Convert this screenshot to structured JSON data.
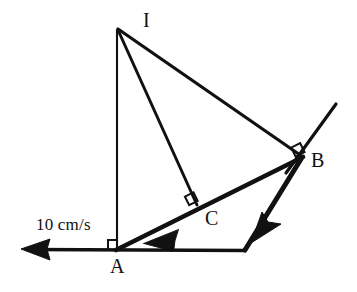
{
  "diagram": {
    "type": "geometry-kinematics-diagram",
    "title": "",
    "stroke_color": "#111111",
    "background_color": "#ffffff",
    "points": [
      {
        "id": "I",
        "label": "I",
        "x": 117,
        "y": 28,
        "label_x": 143,
        "label_y": 12
      },
      {
        "id": "A",
        "label": "A",
        "x": 117,
        "y": 249,
        "label_x": 111,
        "label_y": 258
      },
      {
        "id": "B",
        "label": "B",
        "x": 302,
        "y": 157,
        "label_x": 311,
        "label_y": 152
      },
      {
        "id": "C",
        "label": "C",
        "x": 197,
        "y": 204,
        "label_x": 205,
        "label_y": 209
      }
    ],
    "segments": [
      {
        "name": "segment-I-A",
        "from": "I",
        "to": "A",
        "width": 2.0
      },
      {
        "name": "segment-I-B",
        "from": "I",
        "to": "B",
        "width": 3.0
      },
      {
        "name": "segment-I-C",
        "from": "I",
        "to": "C",
        "width": 3.0
      },
      {
        "name": "segment-A-B",
        "from": "A",
        "to": "B",
        "width": 4.5
      },
      {
        "name": "rod-through-B",
        "from": "B",
        "to": "X",
        "width": 3.0
      }
    ],
    "right_angles": [
      {
        "name": "right-angle-at-A",
        "vertex": "A"
      },
      {
        "name": "right-angle-at-B",
        "vertex": "B"
      },
      {
        "name": "right-angle-at-C",
        "vertex": "C"
      }
    ],
    "arrows": [
      {
        "name": "velocity-arrow-at-A",
        "direction": "left",
        "tip_x": 22,
        "tip_y": 249,
        "label": "10 cm/s"
      },
      {
        "name": "velocity-arrow-on-AB",
        "direction": "down-left",
        "tip_x": 145,
        "tip_y": 243,
        "label": ""
      },
      {
        "name": "velocity-arrow-at-B",
        "direction": "down-left",
        "tip_x": 252,
        "tip_y": 243,
        "label": ""
      }
    ],
    "speed_annotation": {
      "text": "10 cm/s",
      "x": 36,
      "y": 218
    }
  }
}
